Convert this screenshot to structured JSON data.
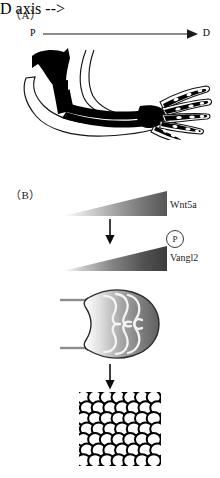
{
  "figure": {
    "panels": [
      {
        "id": "A",
        "label": "（A）"
      },
      {
        "id": "B",
        "label": "（B）"
      }
    ]
  },
  "panel_a": {
    "label": "（A）",
    "axis": {
      "name": "proximal-distal-axis",
      "start_label": "P",
      "end_label": "D",
      "direction": "left-to-right",
      "arrowhead": "right"
    },
    "illustration": {
      "name": "vertebrate-limb-skeleton",
      "description": "Silhouette of a forelimb with black skeletal elements inside a thin outline; five digits with segmented phalanges at the distal end.",
      "digit_count": 5,
      "fill_color": "#000000",
      "outline_color": "#1a1a1a"
    }
  },
  "panel_b": {
    "label": "（B）",
    "gradients": [
      {
        "name": "wnt5a-gradient",
        "label": "Wnt5a",
        "shape": "wedge",
        "thin_end": "left",
        "thick_end": "right",
        "light_color": "#ffffff",
        "dark_color": "#5e5e5e"
      },
      {
        "name": "vangl2-gradient",
        "label": "Vangl2",
        "badge": "P",
        "badge_meaning": "phosphorylation",
        "shape": "wedge",
        "thin_end": "left",
        "thick_end": "right",
        "light_color": "#ffffff",
        "dark_color": "#3d3d3d"
      }
    ],
    "arrows": [
      {
        "name": "arrow-gradient-to-gradient",
        "direction": "down"
      },
      {
        "name": "arrow-bud-to-cells",
        "direction": "down"
      }
    ],
    "limb_bud": {
      "name": "limb-bud-diagram",
      "description": "Rounded limb bud shaded light-to-dark from proximal to distal, with white looping lines representing elongating chondrocyte stacks and two gray proximal stalk lines.",
      "loop_count": 6,
      "body_light_color": "#ffffff",
      "body_dark_color": "#5a5a5a",
      "loop_color": "#f2f2f2"
    },
    "cell_array": {
      "name": "polarized-cell-array",
      "description": "Rectangular field of tightly packed outlined cells arranged in rows and columns.",
      "columns": 7,
      "rows": 7,
      "cell_fill": "#ffffff",
      "cell_outline": "#000000"
    }
  }
}
